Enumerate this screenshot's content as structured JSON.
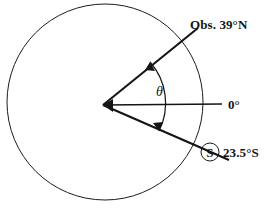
{
  "figure": {
    "type": "geometric-diagram",
    "width": 267,
    "height": 208,
    "background_color": "#ffffff",
    "line_color": "#141414"
  },
  "geometry": {
    "circle": {
      "center_x": 105,
      "center_y": 102,
      "radius": 98
    },
    "vertex": {
      "x": 103,
      "y": 105
    },
    "rays": [
      {
        "name": "observer-ray",
        "angle_deg": 39.0,
        "direction": "up-right"
      },
      {
        "name": "equator-ray",
        "angle_deg": 0.0,
        "direction": "right"
      },
      {
        "name": "subsolar-ray",
        "angle_deg": -23.5,
        "direction": "down-right"
      }
    ],
    "angle_arc": {
      "label": "theta",
      "start_angle_deg": -23.5,
      "end_angle_deg": 39.0,
      "radius": 62,
      "double_headed": true
    }
  },
  "labels": {
    "observer": {
      "text": "Obs. 39°N",
      "value": 39,
      "hemisphere": "N",
      "prefix": "Obs."
    },
    "equator": {
      "text": "0°",
      "value": 0
    },
    "subsolar": {
      "marker": "S",
      "marker_shape": "circled",
      "text": "23.5°S",
      "value": 23.5,
      "hemisphere": "S"
    },
    "angle": {
      "text": "θ",
      "name": "theta"
    }
  }
}
